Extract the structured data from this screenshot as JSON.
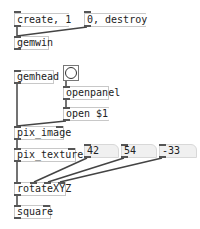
{
  "patch": {
    "messages": {
      "create": "create, 1",
      "destroy": "0, destroy",
      "open": "open $1"
    },
    "objects": {
      "gemwin": "gemwin",
      "gemhead": "gemhead",
      "openpanel": "openpanel",
      "pix_image": "pix_image",
      "pix_texture": "pix_texture",
      "rotateXYZ": "rotateXYZ",
      "square": "square"
    },
    "numbers": {
      "x": "42",
      "y": "54",
      "z": "-33"
    },
    "bang": {
      "icon": "bang-circle-icon"
    }
  }
}
